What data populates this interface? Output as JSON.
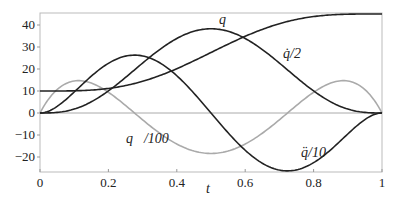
{
  "chart_data": {
    "type": "line",
    "title": "",
    "xlabel": "t",
    "ylabel": "",
    "xlim": [
      0,
      1
    ],
    "ylim": [
      -27,
      45.5
    ],
    "x_ticks": [
      "0",
      "0.2",
      "0.4",
      "0.6",
      "0.8",
      "1"
    ],
    "y_ticks": [
      "-20",
      "-10",
      "0",
      "10",
      "20",
      "30",
      "40"
    ],
    "grid": false,
    "legend": "none (inline curve labels)",
    "x": [
      0,
      0.1,
      0.2,
      0.3,
      0.4,
      0.5,
      0.6,
      0.7,
      0.8,
      0.9,
      1
    ],
    "series": [
      {
        "name": "q",
        "label": "q",
        "color": "#222222",
        "values": [
          10,
          10.1,
          11.0,
          13.4,
          17.6,
          27.5,
          37.4,
          41.6,
          44.0,
          44.9,
          45
        ]
      },
      {
        "name": "q_dot/2",
        "label": "q̇/2",
        "color": "#222222",
        "values": [
          0,
          1.8,
          10.0,
          22.7,
          33.9,
          38.3,
          33.9,
          22.7,
          10.0,
          1.8,
          0
        ]
      },
      {
        "name": "q_ddot/10",
        "label": "q̈/10",
        "color": "#222222",
        "values": [
          0,
          9.7,
          25.8,
          25.9,
          13.5,
          0,
          -13.5,
          -25.9,
          -25.8,
          -9.7,
          0
        ]
      },
      {
        "name": "q_dddot/100",
        "label": "q⃛/100",
        "color": "#aaaaaa",
        "values": [
          0,
          14.5,
          5.2,
          -7.5,
          -15.9,
          -18.4,
          -15.9,
          -7.5,
          5.2,
          14.5,
          0
        ]
      }
    ],
    "annotations": [
      {
        "text": "q",
        "x": 0.53,
        "y": 42
      },
      {
        "text": "q̇/2",
        "x": 0.71,
        "y": 27
      },
      {
        "text": "q̈/10",
        "x": 0.76,
        "y": -18
      },
      {
        "text": "q⃛/100",
        "x": 0.25,
        "y": -11
      }
    ]
  },
  "labels": {
    "q": "q",
    "qd": "q̇/2",
    "qdd": "q̈/10",
    "qddd": "q⃛/100",
    "t": "t"
  },
  "ticks": {
    "x": [
      "0",
      "0.2",
      "0.4",
      "0.6",
      "0.8",
      "1"
    ],
    "y": [
      "−20",
      "−10",
      "0",
      "10",
      "20",
      "30",
      "40"
    ]
  }
}
